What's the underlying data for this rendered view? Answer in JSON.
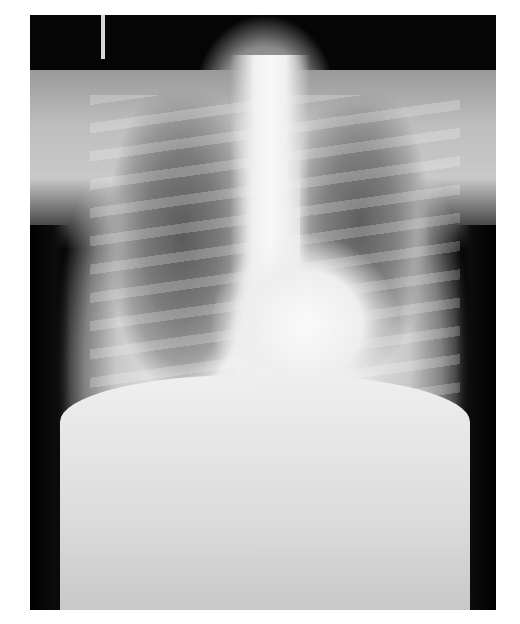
{
  "image": {
    "description": "Frontal (PA) chest radiograph",
    "colors": {
      "background": "#ffffff",
      "film_dark": "#050505",
      "soft_tissue": "#e2e2e2",
      "lung_field": "#5a5a5a"
    }
  }
}
